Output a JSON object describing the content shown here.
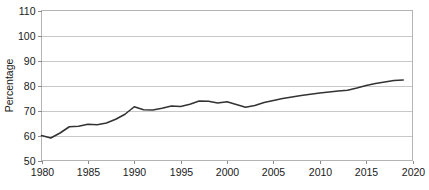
{
  "chart_data": {
    "type": "line",
    "title": "",
    "xlabel": "",
    "ylabel": "Percentage",
    "xlim": [
      1980,
      2020
    ],
    "ylim": [
      50,
      110
    ],
    "grid": true,
    "legend": false,
    "legend_position": "none",
    "line_color": "#333333",
    "grid_color": "#c8c8c8",
    "border_color": "#b4b4b4",
    "background_color": "#ffffff",
    "ytick_labels": [
      "110",
      "100",
      "90",
      "80",
      "70",
      "60",
      "50"
    ],
    "ytick_values": [
      110,
      100,
      90,
      80,
      70,
      60,
      50
    ],
    "xtick_labels": [
      "1980",
      "1985",
      "1990",
      "1995",
      "2000",
      "2005",
      "2010",
      "2015",
      "2020"
    ],
    "xtick_values": [
      1980,
      1985,
      1990,
      1995,
      2000,
      2005,
      2010,
      2015,
      2020
    ],
    "series": [
      {
        "name": "Percentage",
        "x": [
          1980,
          1981,
          1982,
          1983,
          1984,
          1985,
          1986,
          1987,
          1988,
          1989,
          1990,
          1991,
          1992,
          1993,
          1994,
          1995,
          1996,
          1997,
          1998,
          1999,
          2000,
          2001,
          2002,
          2003,
          2004,
          2005,
          2006,
          2007,
          2008,
          2009,
          2010,
          2011,
          2012,
          2013,
          2014,
          2015,
          2016,
          2017,
          2018,
          2019
        ],
        "values": [
          60.0,
          59.0,
          61.0,
          63.5,
          63.7,
          64.5,
          64.3,
          65.0,
          66.5,
          68.5,
          71.5,
          70.3,
          70.2,
          70.9,
          71.8,
          71.6,
          72.5,
          73.8,
          73.7,
          73.0,
          73.5,
          72.4,
          71.3,
          72.0,
          73.2,
          74.0,
          74.8,
          75.4,
          76.0,
          76.5,
          77.0,
          77.4,
          77.8,
          78.1,
          79.0,
          80.0,
          80.8,
          81.4,
          82.0,
          82.2
        ]
      }
    ]
  }
}
